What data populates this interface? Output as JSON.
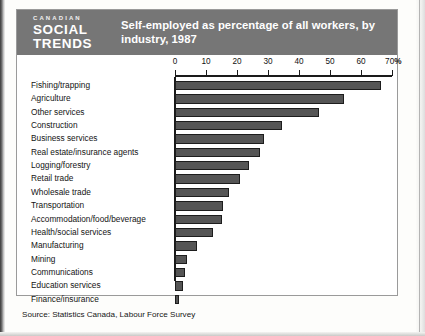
{
  "figure": {
    "logo": {
      "line1": "CANADIAN",
      "line2": "SOCIAL",
      "line3": "TRENDS"
    },
    "title": "Self-employed as percentage of all workers, by industry, 1987",
    "source": "Source:  Statistics Canada, Labour Force Survey"
  },
  "chart_data": {
    "type": "bar",
    "orientation": "horizontal",
    "title": "Self-employed as percentage of all workers, by industry, 1987",
    "xlabel": "%",
    "ylabel": "",
    "xlim": [
      0,
      70
    ],
    "xticks": [
      0,
      10,
      20,
      30,
      40,
      50,
      60,
      70
    ],
    "xtick_labels": [
      "0",
      "10",
      "20",
      "30",
      "40",
      "50",
      "60",
      "70"
    ],
    "xaxis_unit": "%",
    "grid": false,
    "legend": "none",
    "bar_color": "#555555",
    "bar_edge_color": "#1d1d1d",
    "categories": [
      "Fishing/trapping",
      "Agriculture",
      "Other services",
      "Construction",
      "Business services",
      "Real estate/insurance agents",
      "Logging/forestry",
      "Retail trade",
      "Wholesale trade",
      "Transportation",
      "Accommodation/food/beverage",
      "Health/social services",
      "Manufacturing",
      "Mining",
      "Communications",
      "Education services",
      "Finance/insurance"
    ],
    "values": [
      66.5,
      54.5,
      46.5,
      34.5,
      28.7,
      27.5,
      24.0,
      21.0,
      17.5,
      15.5,
      15.0,
      12.3,
      7.0,
      3.9,
      3.2,
      2.6,
      1.3
    ]
  }
}
